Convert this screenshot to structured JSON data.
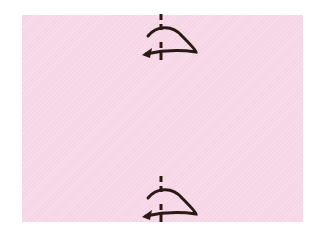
{
  "diagram": {
    "type": "origami-instruction-step",
    "paper": {
      "color": "#f6d6e6",
      "shape": "rectangle"
    },
    "symbols": [
      {
        "name": "rotate-over-symbol",
        "position": "top-center",
        "meaning": "fold/turn over along center line",
        "color": "#2b1a14"
      },
      {
        "name": "rotate-over-symbol",
        "position": "bottom-center",
        "meaning": "fold/turn over along center line",
        "color": "#2b1a14"
      }
    ]
  }
}
